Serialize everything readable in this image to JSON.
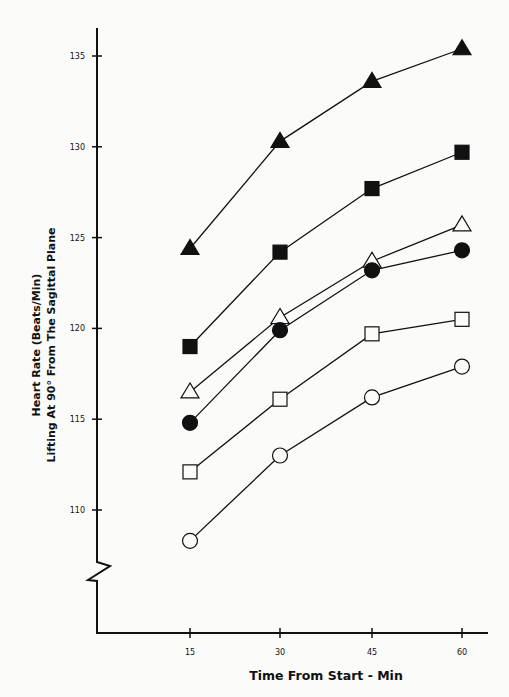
{
  "chart_data": {
    "type": "line",
    "title": "",
    "xlabel": "Time From Start - Min",
    "ylabel_lines": [
      "Heart Rate (Beats/Min)",
      "Lifting At 90° From The Sagittal Plane"
    ],
    "ylabel": "Heart Rate (Beats/Min) Lifting At 90° From The Sagittal Plane",
    "x": [
      15,
      30,
      45,
      60
    ],
    "x_tick_labels": [
      "15",
      "30",
      "45",
      "60"
    ],
    "y_ticks": [
      110,
      115,
      120,
      125,
      130,
      135
    ],
    "y_tick_labels": [
      "110",
      "115",
      "120",
      "125",
      "130",
      "135"
    ],
    "ylim": [
      105,
      137
    ],
    "y_axis_break": true,
    "grid": false,
    "legend": "none",
    "series": [
      {
        "name": "filled-triangle",
        "marker": "triangle",
        "filled": true,
        "values": [
          124.4,
          130.3,
          133.6,
          135.4
        ]
      },
      {
        "name": "filled-square",
        "marker": "square",
        "filled": true,
        "values": [
          119.0,
          124.2,
          127.7,
          129.7
        ]
      },
      {
        "name": "open-triangle",
        "marker": "triangle",
        "filled": false,
        "values": [
          116.5,
          120.6,
          123.7,
          125.7
        ]
      },
      {
        "name": "filled-circle",
        "marker": "circle",
        "filled": true,
        "values": [
          114.8,
          119.9,
          123.2,
          124.3
        ]
      },
      {
        "name": "open-square",
        "marker": "square",
        "filled": false,
        "values": [
          112.1,
          116.1,
          119.7,
          120.5
        ]
      },
      {
        "name": "open-circle",
        "marker": "circle",
        "filled": false,
        "values": [
          108.3,
          113.0,
          116.2,
          117.9
        ]
      }
    ]
  },
  "colors": {
    "ink": "#111111",
    "background": "#fbfbfa"
  }
}
